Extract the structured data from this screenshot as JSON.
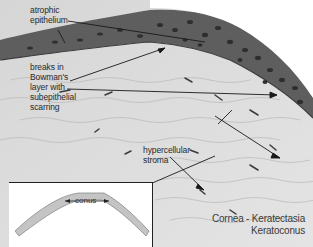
{
  "figure": {
    "title_line1": "Cornea - Keratectasia",
    "title_line2": "Keratoconus",
    "colors": {
      "epithelium": "#5e5e5e",
      "stroma": "#d9d9d9",
      "background": "#ffffff",
      "label_text": "#2a2a2a",
      "arrow": "#1a1a1a"
    }
  },
  "labels": [
    {
      "id": "epithelium",
      "text": "atrophic\nepithelium"
    },
    {
      "id": "bowman",
      "text": "breaks in\nBowman's\nlayer with\nsubepithelial\nscarring"
    },
    {
      "id": "stroma",
      "text": "hypercellular\nstroma"
    }
  ],
  "inset": {
    "label": "conus"
  }
}
